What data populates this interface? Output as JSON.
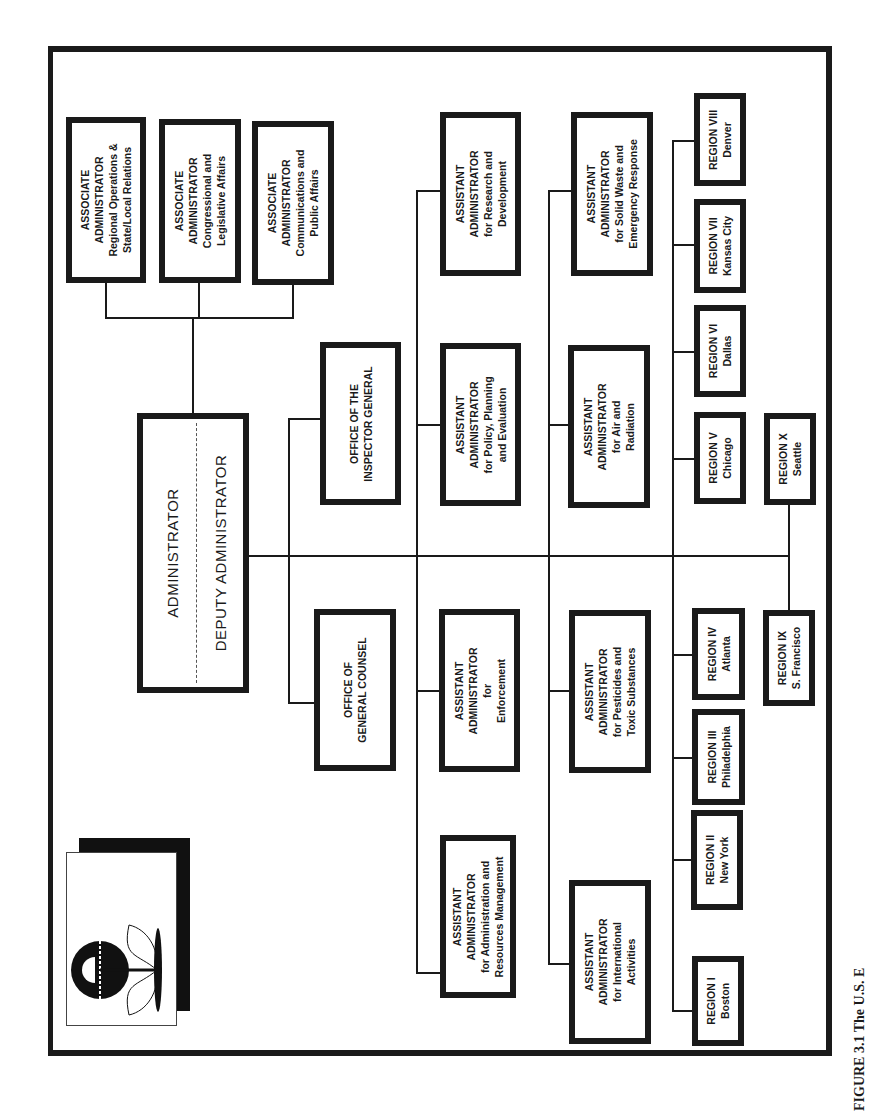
{
  "figure": {
    "caption_visible": "FIGURE 3.1   The U.S. E",
    "orientation": "rotated 90° counter-clockwise"
  },
  "logo": {
    "icon": "epa-flower-logo-icon"
  },
  "administrator": {
    "title": "ADMINISTRATOR",
    "deputy": "DEPUTY ADMINISTRATOR"
  },
  "associates": [
    {
      "lines": [
        "ASSOCIATE",
        "ADMINISTRATOR",
        "Regional Operations &",
        "State/Local Relations"
      ]
    },
    {
      "lines": [
        "ASSOCIATE",
        "ADMINISTRATOR",
        "Congressional and",
        "Legislative Affairs"
      ]
    },
    {
      "lines": [
        "ASSOCIATE",
        "ADMINISTRATOR",
        "Communications and",
        "Public Affairs"
      ]
    }
  ],
  "offices": [
    {
      "lines": [
        "OFFICE OF THE",
        "INSPECTOR GENERAL"
      ]
    },
    {
      "lines": [
        "OFFICE OF",
        "GENERAL COUNSEL"
      ]
    }
  ],
  "assistants": [
    {
      "lines": [
        "ASSISTANT",
        "ADMINISTRATOR",
        "for Research and",
        "Development"
      ]
    },
    {
      "lines": [
        "ASSISTANT",
        "ADMINISTRATOR",
        "for Policy, Planning",
        "and Evaluation"
      ]
    },
    {
      "lines": [
        "ASSISTANT",
        "ADMINISTRATOR",
        "for",
        "Enforcement"
      ]
    },
    {
      "lines": [
        "ASSISTANT",
        "ADMINISTRATOR",
        "for Administration and",
        "Resources Management"
      ]
    },
    {
      "lines": [
        "ASSISTANT",
        "ADMINISTRATOR",
        "for Solid Waste and",
        "Emergency Response"
      ]
    },
    {
      "lines": [
        "ASSISTANT",
        "ADMINISTRATOR",
        "for Air and",
        "Radiation"
      ]
    },
    {
      "lines": [
        "ASSISTANT",
        "ADMINISTRATOR",
        "for Pesticides and",
        "Toxic Substances"
      ]
    },
    {
      "lines": [
        "ASSISTANT",
        "ADMINISTRATOR",
        "for International",
        "Activities"
      ]
    }
  ],
  "regions": [
    {
      "name": "REGION I",
      "city": "Boston"
    },
    {
      "name": "REGION II",
      "city": "New York"
    },
    {
      "name": "REGION III",
      "city": "Philadelphia"
    },
    {
      "name": "REGION IV",
      "city": "Atlanta"
    },
    {
      "name": "REGION V",
      "city": "Chicago"
    },
    {
      "name": "REGION VI",
      "city": "Dallas"
    },
    {
      "name": "REGION VII",
      "city": "Kansas City"
    },
    {
      "name": "REGION VIII",
      "city": "Denver"
    },
    {
      "name": "REGION IX",
      "city": "S. Francisco"
    },
    {
      "name": "REGION X",
      "city": "Seattle"
    }
  ]
}
